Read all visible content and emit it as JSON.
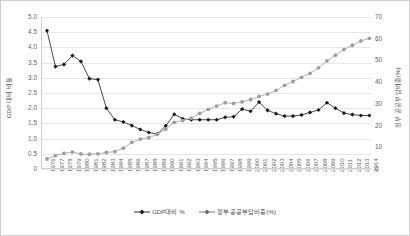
{
  "chart_data": {
    "type": "line",
    "title": "",
    "xlabel": "",
    "ylabel": "GDP 대비 비율",
    "y2label": "정부 공공부담비중(%)",
    "grid": true,
    "legend_position": "bottom-center",
    "ylim": [
      0,
      5.0
    ],
    "y2lim": [
      0,
      70
    ],
    "ytick_labels": [
      "5.0",
      "4.5",
      "4.0",
      "3.5",
      "3.0",
      "2.5",
      "2.0",
      "1.5",
      "1.0",
      "0.5",
      "0"
    ],
    "y2tick_labels": [
      "70",
      "60",
      "50",
      "40",
      "30",
      "20",
      "10",
      "0"
    ],
    "categories": [
      "1976",
      "1977",
      "1978",
      "1979",
      "1980",
      "1981",
      "1982",
      "1983",
      "1984",
      "1985",
      "1986",
      "1987",
      "1988",
      "1989",
      "1990",
      "1991",
      "1992",
      "1993",
      "1994",
      "1995",
      "1996",
      "1997",
      "1998",
      "1999",
      "2000",
      "2001",
      "2002",
      "2003",
      "2004",
      "2005",
      "2006",
      "2007",
      "2008",
      "2009",
      "2010",
      "2011",
      "2012",
      "2013",
      "2014"
    ],
    "series": [
      {
        "name": "GDP대비 %",
        "axis": "left",
        "color": "#1a1a1a",
        "marker": "diamond",
        "values": [
          4.55,
          3.37,
          3.44,
          3.73,
          3.54,
          2.97,
          2.94,
          2.0,
          1.62,
          1.55,
          1.43,
          1.3,
          1.2,
          1.15,
          1.42,
          1.8,
          1.65,
          1.62,
          1.62,
          1.62,
          1.62,
          1.7,
          1.72,
          1.97,
          1.9,
          2.2,
          1.93,
          1.82,
          1.74,
          1.74,
          1.78,
          1.86,
          1.94,
          2.18,
          2.0,
          1.84,
          1.79,
          1.76,
          1.76
        ]
      },
      {
        "name": "정부 공공부담비중(%)",
        "axis": "right",
        "color": "#9e9e9e",
        "marker": "circle",
        "values": [
          4.6,
          6.2,
          7.2,
          7.8,
          6.9,
          6.8,
          7.0,
          7.6,
          8.0,
          9.6,
          12.3,
          13.8,
          14.4,
          16.0,
          18.3,
          21.5,
          22.3,
          23.4,
          25.6,
          27.5,
          29.0,
          30.5,
          30.2,
          30.9,
          32.0,
          33.4,
          34.5,
          36.2,
          38.5,
          40.3,
          42.2,
          44.0,
          46.6,
          49.8,
          52.4,
          55.0,
          57.0,
          59.0,
          60.2
        ]
      }
    ]
  },
  "legend": {
    "items": [
      {
        "label": "GDP대비 %",
        "color": "#1a1a1a",
        "marker": "diamond"
      },
      {
        "label": "정부 공공부담비중(%)",
        "color": "#6b6b6b",
        "marker": "diamond"
      }
    ]
  }
}
